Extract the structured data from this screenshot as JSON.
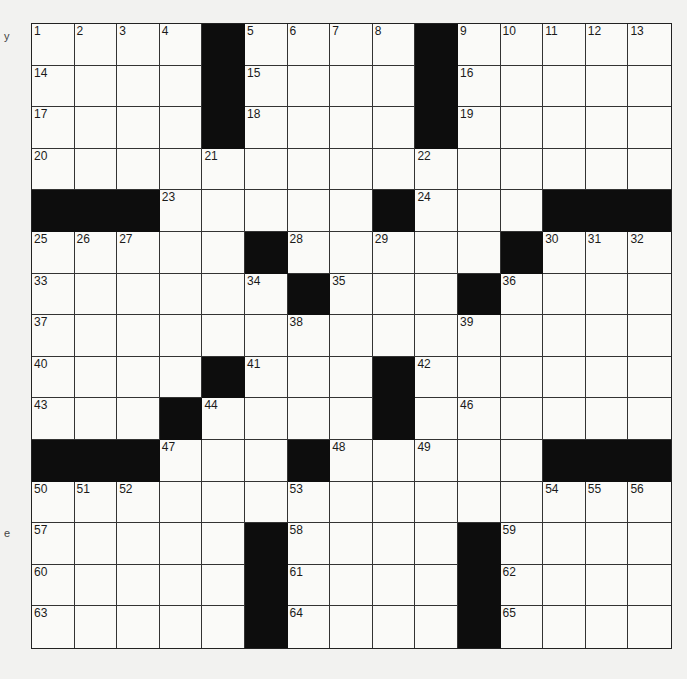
{
  "puzzle": {
    "rows": 15,
    "cols": 15,
    "layout": [
      "....#....#.....",
      "....#....#.....",
      "....#....#.....",
      "...............",
      "###.....#...###",
      ".....#.....#...",
      "......#...#....",
      "...............",
      "....#...#......",
      "...#....#......",
      "###...#.....###",
      "...............",
      ".....#....#....",
      ".....#....#....",
      ".....#....#...."
    ],
    "numbers": [
      {
        "r": 0,
        "c": 0,
        "n": "1"
      },
      {
        "r": 0,
        "c": 1,
        "n": "2"
      },
      {
        "r": 0,
        "c": 2,
        "n": "3"
      },
      {
        "r": 0,
        "c": 3,
        "n": "4"
      },
      {
        "r": 0,
        "c": 5,
        "n": "5"
      },
      {
        "r": 0,
        "c": 6,
        "n": "6"
      },
      {
        "r": 0,
        "c": 7,
        "n": "7"
      },
      {
        "r": 0,
        "c": 8,
        "n": "8"
      },
      {
        "r": 0,
        "c": 10,
        "n": "9"
      },
      {
        "r": 0,
        "c": 11,
        "n": "10"
      },
      {
        "r": 0,
        "c": 12,
        "n": "11"
      },
      {
        "r": 0,
        "c": 13,
        "n": "12"
      },
      {
        "r": 0,
        "c": 14,
        "n": "13"
      },
      {
        "r": 1,
        "c": 0,
        "n": "14"
      },
      {
        "r": 1,
        "c": 5,
        "n": "15"
      },
      {
        "r": 1,
        "c": 10,
        "n": "16"
      },
      {
        "r": 2,
        "c": 0,
        "n": "17"
      },
      {
        "r": 2,
        "c": 5,
        "n": "18"
      },
      {
        "r": 2,
        "c": 10,
        "n": "19"
      },
      {
        "r": 3,
        "c": 0,
        "n": "20"
      },
      {
        "r": 3,
        "c": 4,
        "n": "21"
      },
      {
        "r": 3,
        "c": 9,
        "n": "22"
      },
      {
        "r": 4,
        "c": 3,
        "n": "23"
      },
      {
        "r": 4,
        "c": 9,
        "n": "24"
      },
      {
        "r": 5,
        "c": 0,
        "n": "25"
      },
      {
        "r": 5,
        "c": 1,
        "n": "26"
      },
      {
        "r": 5,
        "c": 2,
        "n": "27"
      },
      {
        "r": 5,
        "c": 6,
        "n": "28"
      },
      {
        "r": 5,
        "c": 8,
        "n": "29"
      },
      {
        "r": 5,
        "c": 12,
        "n": "30"
      },
      {
        "r": 5,
        "c": 13,
        "n": "31"
      },
      {
        "r": 5,
        "c": 14,
        "n": "32"
      },
      {
        "r": 6,
        "c": 0,
        "n": "33"
      },
      {
        "r": 6,
        "c": 5,
        "n": "34"
      },
      {
        "r": 6,
        "c": 7,
        "n": "35"
      },
      {
        "r": 6,
        "c": 11,
        "n": "36"
      },
      {
        "r": 7,
        "c": 0,
        "n": "37"
      },
      {
        "r": 7,
        "c": 6,
        "n": "38"
      },
      {
        "r": 7,
        "c": 10,
        "n": "39"
      },
      {
        "r": 8,
        "c": 0,
        "n": "40"
      },
      {
        "r": 8,
        "c": 5,
        "n": "41"
      },
      {
        "r": 8,
        "c": 9,
        "n": "42"
      },
      {
        "r": 9,
        "c": 0,
        "n": "43"
      },
      {
        "r": 9,
        "c": 4,
        "n": "44"
      },
      {
        "r": 9,
        "c": 8,
        "n": "45"
      },
      {
        "r": 9,
        "c": 10,
        "n": "46"
      },
      {
        "r": 10,
        "c": 3,
        "n": "47"
      },
      {
        "r": 10,
        "c": 7,
        "n": "48"
      },
      {
        "r": 10,
        "c": 9,
        "n": "49"
      },
      {
        "r": 11,
        "c": 0,
        "n": "50"
      },
      {
        "r": 11,
        "c": 1,
        "n": "51"
      },
      {
        "r": 11,
        "c": 2,
        "n": "52"
      },
      {
        "r": 11,
        "c": 6,
        "n": "53"
      },
      {
        "r": 11,
        "c": 12,
        "n": "54"
      },
      {
        "r": 11,
        "c": 13,
        "n": "55"
      },
      {
        "r": 11,
        "c": 14,
        "n": "56"
      },
      {
        "r": 12,
        "c": 0,
        "n": "57"
      },
      {
        "r": 12,
        "c": 6,
        "n": "58"
      },
      {
        "r": 12,
        "c": 11,
        "n": "59"
      },
      {
        "r": 13,
        "c": 0,
        "n": "60"
      },
      {
        "r": 13,
        "c": 6,
        "n": "61"
      },
      {
        "r": 13,
        "c": 11,
        "n": "62"
      },
      {
        "r": 14,
        "c": 0,
        "n": "63"
      },
      {
        "r": 14,
        "c": 6,
        "n": "64"
      },
      {
        "r": 14,
        "c": 11,
        "n": "65"
      }
    ]
  },
  "margin_marks": {
    "top": "y",
    "bottom": "e"
  }
}
